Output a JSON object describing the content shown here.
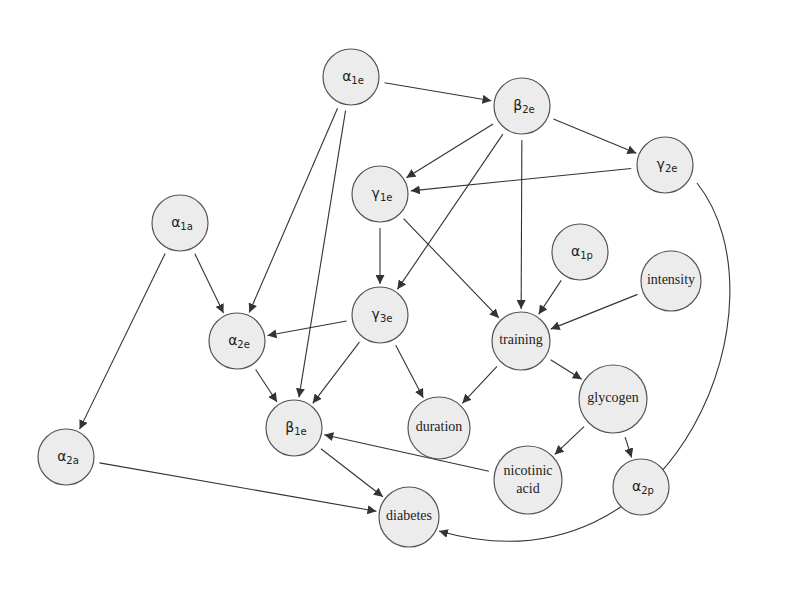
{
  "diagram": {
    "type": "directed-graph",
    "nodes": [
      {
        "id": "a1e",
        "base": "α",
        "sub": "1e",
        "x": 351,
        "y": 77,
        "r": 28
      },
      {
        "id": "b2e",
        "base": "β",
        "sub": "2e",
        "x": 522,
        "y": 106,
        "r": 28
      },
      {
        "id": "g2e",
        "base": "γ",
        "sub": "2e",
        "x": 665,
        "y": 165,
        "r": 28
      },
      {
        "id": "g1e",
        "base": "γ",
        "sub": "1e",
        "x": 380,
        "y": 194,
        "r": 28
      },
      {
        "id": "a1a",
        "base": "α",
        "sub": "1a",
        "x": 180,
        "y": 223,
        "r": 28
      },
      {
        "id": "a1p",
        "base": "α",
        "sub": "1p",
        "x": 580,
        "y": 252,
        "r": 28
      },
      {
        "id": "intensity",
        "label": "intensity",
        "x": 671,
        "y": 281,
        "r": 30
      },
      {
        "id": "g3e",
        "base": "γ",
        "sub": "3e",
        "x": 380,
        "y": 315,
        "r": 28
      },
      {
        "id": "training",
        "label": "training",
        "x": 521,
        "y": 341,
        "r": 29
      },
      {
        "id": "a2e",
        "base": "α",
        "sub": "2e",
        "x": 237,
        "y": 341,
        "r": 28
      },
      {
        "id": "glycogen",
        "label": "glycogen",
        "x": 613,
        "y": 399,
        "r": 34
      },
      {
        "id": "duration",
        "label": "duration",
        "x": 439,
        "y": 428,
        "r": 31
      },
      {
        "id": "b1e",
        "base": "β",
        "sub": "1e",
        "x": 294,
        "y": 428,
        "r": 28
      },
      {
        "id": "a2a",
        "base": "α",
        "sub": "2a",
        "x": 66,
        "y": 457,
        "r": 28
      },
      {
        "id": "nicotinic",
        "label": "nicotinic",
        "label2": "acid",
        "x": 528,
        "y": 480,
        "r": 34
      },
      {
        "id": "a2p",
        "base": "α",
        "sub": "2p",
        "x": 641,
        "y": 487,
        "r": 28
      },
      {
        "id": "diabetes",
        "label": "diabetes",
        "x": 409,
        "y": 517,
        "r": 30
      }
    ],
    "edges": [
      {
        "from": "a1e",
        "to": "b2e"
      },
      {
        "from": "a1e",
        "to": "a2e"
      },
      {
        "from": "a1e",
        "to": "b1e"
      },
      {
        "from": "b2e",
        "to": "g1e"
      },
      {
        "from": "b2e",
        "to": "g2e"
      },
      {
        "from": "b2e",
        "to": "g3e"
      },
      {
        "from": "b2e",
        "to": "training"
      },
      {
        "from": "g2e",
        "to": "g1e"
      },
      {
        "from": "g2e",
        "to": "diabetes",
        "curved": true
      },
      {
        "from": "g1e",
        "to": "g3e"
      },
      {
        "from": "g1e",
        "to": "training"
      },
      {
        "from": "a1a",
        "to": "a2e"
      },
      {
        "from": "a1a",
        "to": "a2a"
      },
      {
        "from": "a1p",
        "to": "training"
      },
      {
        "from": "intensity",
        "to": "training"
      },
      {
        "from": "g3e",
        "to": "a2e"
      },
      {
        "from": "g3e",
        "to": "b1e"
      },
      {
        "from": "g3e",
        "to": "duration"
      },
      {
        "from": "a2e",
        "to": "b1e"
      },
      {
        "from": "training",
        "to": "duration"
      },
      {
        "from": "training",
        "to": "glycogen"
      },
      {
        "from": "glycogen",
        "to": "nicotinic"
      },
      {
        "from": "glycogen",
        "to": "a2p"
      },
      {
        "from": "nicotinic",
        "to": "b1e"
      },
      {
        "from": "b1e",
        "to": "diabetes"
      },
      {
        "from": "a2a",
        "to": "diabetes"
      }
    ],
    "colors": {
      "node_fill": "#ececec",
      "node_stroke": "#555555",
      "edge": "#333333",
      "background": "#ffffff"
    }
  }
}
